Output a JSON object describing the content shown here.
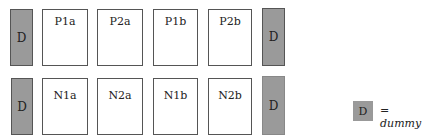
{
  "dummy_label": "D",
  "top_row": {
    "cells": [
      "P1a",
      "P2a",
      "P1b",
      "P2b"
    ]
  },
  "bottom_row": {
    "cells": [
      "N1a",
      "N2a",
      "N1b",
      "N2b"
    ]
  },
  "legend": {
    "symbol": "D",
    "text": "= dummy"
  },
  "colors": {
    "dummy_fill": "#9a9a9a",
    "cell_fill": "#ffffff",
    "border": "#555555"
  }
}
